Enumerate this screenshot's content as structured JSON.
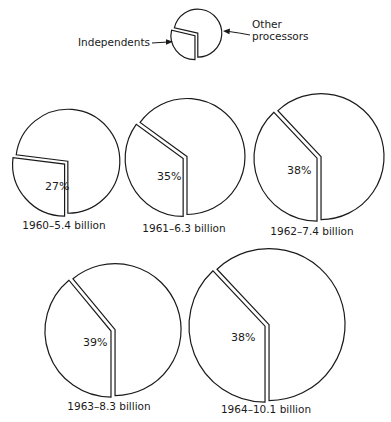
{
  "chart_data": {
    "type": "pie",
    "title": "",
    "legend": {
      "independents_label": "Independents",
      "other_label_line1": "Other",
      "other_label_line2": "processors",
      "pie": {
        "cx": 197,
        "cy": 34,
        "r": 24,
        "pct": 27
      },
      "independents_text": {
        "x": 150,
        "y": 46
      },
      "other_text": {
        "x": 252,
        "y1": 28,
        "y2": 40
      }
    },
    "series": [
      {
        "name": "Independents",
        "values": [
          27,
          35,
          38,
          39,
          38
        ]
      },
      {
        "name": "Other processors",
        "values": [
          73,
          65,
          62,
          61,
          62
        ]
      }
    ],
    "categories": [
      "1960",
      "1961",
      "1962",
      "1963",
      "1964"
    ],
    "totals_billion": [
      5.4,
      6.3,
      7.4,
      8.3,
      10.1
    ],
    "pies": [
      {
        "year": "1960",
        "total": "5.4 billion",
        "label": "1960–5.4 billion",
        "pct": 27,
        "pct_label": "27%",
        "cx": 67,
        "cy": 162,
        "r": 52,
        "label_x": 64,
        "label_y": 229,
        "pct_x": 45,
        "pct_y": 190
      },
      {
        "year": "1961",
        "total": "6.3 billion",
        "label": "1961–6.3 billion",
        "pct": 35,
        "pct_label": "35%",
        "cx": 186,
        "cy": 157,
        "r": 58,
        "label_x": 184,
        "label_y": 232,
        "pct_x": 157,
        "pct_y": 180
      },
      {
        "year": "1962",
        "total": "7.4 billion",
        "label": "1962–7.4 billion",
        "pct": 38,
        "pct_label": "38%",
        "cx": 320,
        "cy": 157,
        "r": 63,
        "label_x": 312,
        "label_y": 235,
        "pct_x": 287,
        "pct_y": 174
      },
      {
        "year": "1963",
        "total": "8.3 billion",
        "label": "1963–8.3 billion",
        "pct": 39,
        "pct_label": "39%",
        "cx": 114,
        "cy": 330,
        "r": 66,
        "label_x": 109,
        "label_y": 410,
        "pct_x": 83,
        "pct_y": 346
      },
      {
        "year": "1964",
        "total": "10.1 billion",
        "label": "1964–10.1 billion",
        "pct": 38,
        "pct_label": "38%",
        "cx": 268,
        "cy": 325,
        "r": 76,
        "label_x": 266,
        "label_y": 413,
        "pct_x": 231,
        "pct_y": 341
      }
    ]
  }
}
